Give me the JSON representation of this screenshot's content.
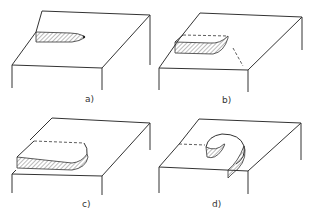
{
  "panels": [
    {
      "label": "a)",
      "stage": "initial chip formation - short hatched protrusion with pointed tip"
    },
    {
      "label": "b)",
      "stage": "chip lengthening - hatched strip with dashed outline and curved end"
    },
    {
      "label": "c)",
      "stage": "chip extended - longer hatched strip with dashed top edge"
    },
    {
      "label": "d)",
      "stage": "chip curling - spiral/curled hatched chip"
    }
  ],
  "colors": {
    "line": "#333333",
    "background": "#ffffff",
    "hatch": "#555555"
  }
}
